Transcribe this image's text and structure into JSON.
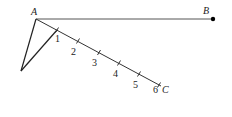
{
  "points": {
    "A": {
      "label": "A",
      "x": 36,
      "y": 19
    },
    "B": {
      "label": "B",
      "x": 213,
      "y": 19
    },
    "C": {
      "label": "C",
      "x": 164,
      "y": 91
    },
    "D": {
      "x": 21,
      "y": 71
    }
  },
  "ray_AC": {
    "start": {
      "x": 36,
      "y": 19
    },
    "end": {
      "x": 161,
      "y": 86
    },
    "ticks": [
      {
        "label": "1",
        "x": 57,
        "y": 30
      },
      {
        "label": "2",
        "x": 78,
        "y": 41
      },
      {
        "label": "3",
        "x": 99,
        "y": 52.5
      },
      {
        "label": "4",
        "x": 119,
        "y": 63
      },
      {
        "label": "5",
        "x": 139,
        "y": 74
      },
      {
        "label": "6",
        "x": 159,
        "y": 85
      }
    ]
  },
  "segments": [
    "AB",
    "AC",
    "AD",
    "D1"
  ]
}
